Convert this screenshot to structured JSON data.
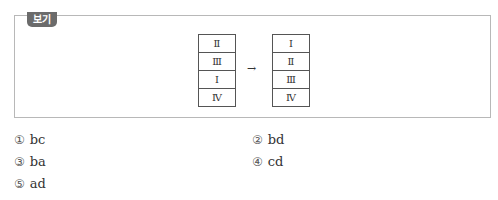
{
  "box": {
    "label": "보기",
    "left_table": [
      "Ⅱ",
      "Ⅲ",
      "Ⅰ",
      "Ⅳ"
    ],
    "arrow": "→",
    "right_table": [
      "Ⅰ",
      "Ⅱ",
      "Ⅲ",
      "Ⅳ"
    ]
  },
  "options": [
    {
      "num": "①",
      "text": "bc"
    },
    {
      "num": "②",
      "text": "bd"
    },
    {
      "num": "③",
      "text": "ba"
    },
    {
      "num": "④",
      "text": "cd"
    },
    {
      "num": "⑤",
      "text": "ad"
    }
  ]
}
